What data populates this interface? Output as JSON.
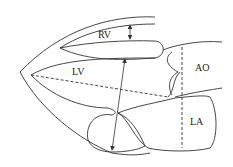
{
  "diagram": {
    "type": "echocardiography parasternal long-axis schematic",
    "labels": {
      "rv": "RV",
      "lv": "LV",
      "ao": "AO",
      "la": "LA"
    },
    "measurements": [
      {
        "name": "RV dimension",
        "style": "double-arrow"
      },
      {
        "name": "LV diameter",
        "style": "double-arrow"
      },
      {
        "name": "LV long axis",
        "style": "dashed"
      },
      {
        "name": "AO/LA dimension",
        "style": "dashed"
      }
    ],
    "colors": {
      "stroke": "#333333",
      "background": "#ffffff"
    }
  }
}
